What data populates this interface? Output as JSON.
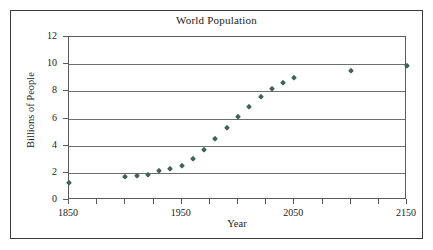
{
  "chart_data": {
    "type": "scatter",
    "title": "World Population",
    "xlabel": "Year",
    "ylabel": "Billions of People",
    "xlim": [
      1850,
      2150
    ],
    "ylim": [
      0,
      12
    ],
    "xticks": [
      1850,
      1950,
      2050,
      2150
    ],
    "xtick_labels": [
      "1850",
      "1950",
      "2050",
      "2150"
    ],
    "xminor_step": 25,
    "yticks": [
      0,
      2,
      4,
      6,
      8,
      10,
      12
    ],
    "ytick_labels": [
      "0",
      "2",
      "4",
      "6",
      "8",
      "10",
      "12"
    ],
    "grid": true,
    "legend": false,
    "marker": "diamond",
    "marker_color": "#3e6358",
    "points": [
      {
        "x": 1850,
        "y": 1.25
      },
      {
        "x": 1900,
        "y": 1.7
      },
      {
        "x": 1910,
        "y": 1.8
      },
      {
        "x": 1920,
        "y": 1.85
      },
      {
        "x": 1930,
        "y": 2.1
      },
      {
        "x": 1940,
        "y": 2.3
      },
      {
        "x": 1950,
        "y": 2.5
      },
      {
        "x": 1960,
        "y": 3.05
      },
      {
        "x": 1970,
        "y": 3.7
      },
      {
        "x": 1980,
        "y": 4.5
      },
      {
        "x": 1990,
        "y": 5.3
      },
      {
        "x": 2000,
        "y": 6.1
      },
      {
        "x": 2010,
        "y": 6.85
      },
      {
        "x": 2020,
        "y": 7.6
      },
      {
        "x": 2030,
        "y": 8.15
      },
      {
        "x": 2040,
        "y": 8.65
      },
      {
        "x": 2050,
        "y": 9.0
      },
      {
        "x": 2100,
        "y": 9.5
      },
      {
        "x": 2150,
        "y": 9.85
      }
    ]
  }
}
